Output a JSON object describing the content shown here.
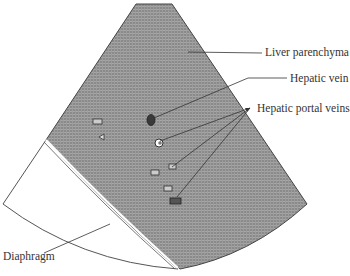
{
  "diagram": {
    "type": "ultrasound sector schematic",
    "labels": {
      "liver_parenchyma": "Liver parenchyma",
      "hepatic_vein": "Hepatic vein",
      "hepatic_portal_veins": "Hepatic portal veins",
      "diaphragm": "Diaphragm"
    },
    "colors": {
      "liver_fill": "#8c8c8c",
      "grid_line": "#a8a8a8",
      "outline": "#444444",
      "background": "#ffffff"
    }
  }
}
